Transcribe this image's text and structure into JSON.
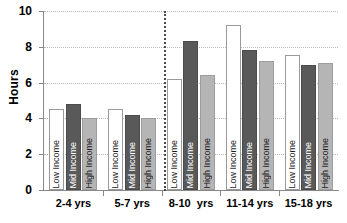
{
  "chart_data": {
    "type": "bar",
    "title": "",
    "xlabel": "",
    "ylabel": "Hours",
    "ylim": [
      0,
      10
    ],
    "yticks": [
      0,
      2,
      4,
      6,
      8,
      10
    ],
    "grid": true,
    "legend": "none (series names printed inside bars)",
    "categories": [
      "2-4 yrs",
      "5-7 yrs",
      "8-10  yrs",
      "11-14 yrs",
      "15-18 yrs"
    ],
    "series": [
      {
        "name": "Low Income",
        "values": [
          4.55,
          4.5,
          6.2,
          9.2,
          7.55
        ]
      },
      {
        "name": "Mid Income",
        "values": [
          4.8,
          4.2,
          8.3,
          7.8,
          7.0
        ]
      },
      {
        "name": "High Income",
        "values": [
          4.05,
          4.05,
          6.4,
          7.2,
          7.1
        ]
      }
    ],
    "annotations": [
      {
        "type": "vertical-dotted-divider",
        "after_category": "5-7 yrs"
      }
    ],
    "colors": {
      "low": "#ffffff",
      "mid": "#595959",
      "high": "#b5b5b5",
      "gridline": "#b9b9b9",
      "axis": "#888888",
      "divider": "#4a4a4a"
    }
  }
}
